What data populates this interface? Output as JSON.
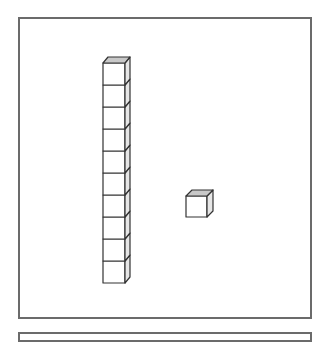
{
  "diagram": {
    "rod": {
      "cube_count": 10,
      "label": "ten"
    },
    "unit": {
      "cube_count": 1,
      "label": "one"
    },
    "represented_value": 11,
    "colors": {
      "stroke": "#333333",
      "frame": "#6b6b6b",
      "top_face": "#c8c8c8",
      "side_face": "#e6e6e6",
      "front_face": "#ffffff"
    }
  }
}
